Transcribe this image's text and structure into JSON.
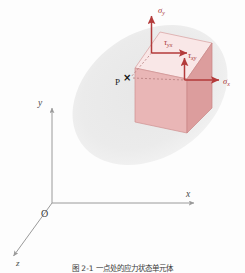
{
  "figure": {
    "kind": "stress-element-diagram",
    "title_caption": "图 2-1  一点处的应力状态单元体",
    "background_blob": {
      "name": "body-region-blob",
      "color": "#ebebeb",
      "cx": 150,
      "cy": 95,
      "rx": 84,
      "ry": 62,
      "rotation_deg": -35
    },
    "colors": {
      "face_front": "#e8b4b4",
      "face_right": "#dd9f9f",
      "face_top": "#f9e6e6",
      "edge": "#c98a8a",
      "stress_arrow": "#b33a3a",
      "axis": "#9a9a9a",
      "dashed": "#b07878",
      "point_marker": "#1a1a1a",
      "background": "#fdfdfd"
    },
    "cube": {
      "name": "stress-element-cube",
      "front_face": "135,68 135,122 187,133 187,79",
      "right_face": "187,79 187,133 212,108 212,43",
      "top_face": "135,68 187,79 212,43 160,32"
    },
    "stress_arrows": [
      {
        "name": "sigma-y-arrow",
        "label": "σ",
        "subscript": "y",
        "direction": "up",
        "origin": [
          152,
          53
        ],
        "tip": [
          152,
          14
        ],
        "label_pos": [
          160,
          11
        ]
      },
      {
        "name": "tau-yx-arrow",
        "label": "τ",
        "subscript": "yx",
        "direction": "right",
        "origin": [
          152,
          53
        ],
        "tip": [
          190,
          53
        ],
        "label_pos": [
          168,
          42
        ]
      },
      {
        "name": "tau-xy-arrow",
        "label": "τ",
        "subscript": "xy",
        "direction": "up",
        "origin": [
          185,
          80
        ],
        "tip": [
          185,
          57
        ],
        "label_pos": [
          190,
          57
        ]
      },
      {
        "name": "sigma-x-arrow",
        "label": "σ",
        "subscript": "x",
        "direction": "right",
        "origin": [
          185,
          80
        ],
        "tip": [
          222,
          80
        ],
        "label_pos": [
          226,
          84
        ]
      }
    ],
    "point": {
      "name": "point-p",
      "label": "P",
      "marker": "×",
      "label_pos": [
        118,
        84
      ],
      "marker_pos": [
        128,
        78
      ]
    },
    "dashed_lines": [
      {
        "name": "dashed-vertical-to-p",
        "from": [
          152,
          53
        ],
        "to": [
          130,
          78
        ]
      },
      {
        "name": "dashed-horizontal-from-p",
        "from": [
          132,
          78
        ],
        "to": [
          186,
          80
        ]
      }
    ],
    "axes": [
      {
        "name": "y-axis",
        "label": "y",
        "from": [
          52,
          203
        ],
        "to": [
          52,
          106
        ],
        "label_pos": [
          42,
          104
        ]
      },
      {
        "name": "x-axis",
        "label": "x",
        "from": [
          52,
          203
        ],
        "to": [
          196,
          203
        ],
        "label_pos": [
          191,
          196
        ]
      },
      {
        "name": "z-axis",
        "label": "z",
        "from": [
          52,
          203
        ],
        "to": [
          12,
          258
        ],
        "label_pos": [
          17,
          265
        ]
      }
    ],
    "origin": {
      "name": "origin-label",
      "label": "O",
      "pos": [
        44,
        215
      ]
    }
  }
}
